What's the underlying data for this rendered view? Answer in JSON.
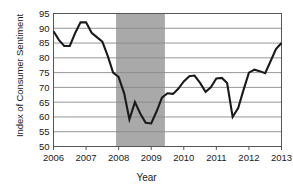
{
  "chart_data": {
    "type": "line",
    "title": "",
    "xlabel": "Year",
    "ylabel": "Index of Consumer Sentiment",
    "xlim": [
      2006.0,
      2013.0
    ],
    "ylim": [
      50,
      95
    ],
    "grid": true,
    "legend": null,
    "ytick_labels": [
      "50",
      "55",
      "60",
      "65",
      "70",
      "75",
      "80",
      "85",
      "90",
      "95"
    ],
    "ytick_values": [
      50,
      55,
      60,
      65,
      70,
      75,
      80,
      85,
      90,
      95
    ],
    "xtick_labels": [
      "2006",
      "2007",
      "2008",
      "2009",
      "2010",
      "2011",
      "2012",
      "2013"
    ],
    "xtick_values": [
      2006,
      2007,
      2008,
      2009,
      2010,
      2011,
      2012,
      2013
    ],
    "line_color": "#1a1a1a",
    "line_width": 2.1,
    "shaded_region": {
      "label": "recession-band",
      "x_start": 2007.92,
      "x_end": 2009.42,
      "color": "#a9a9a9"
    },
    "series": [
      {
        "name": "Index of Consumer Sentiment",
        "x": [
          2006.0,
          2006.17,
          2006.33,
          2006.5,
          2006.67,
          2006.83,
          2007.0,
          2007.17,
          2007.33,
          2007.5,
          2007.67,
          2007.83,
          2008.0,
          2008.17,
          2008.33,
          2008.5,
          2008.67,
          2008.83,
          2009.0,
          2009.17,
          2009.33,
          2009.5,
          2009.67,
          2009.83,
          2010.0,
          2010.17,
          2010.33,
          2010.5,
          2010.67,
          2010.83,
          2011.0,
          2011.17,
          2011.33,
          2011.5,
          2011.67,
          2011.83,
          2012.0,
          2012.17,
          2012.33,
          2012.5,
          2012.67,
          2012.83,
          2013.0
        ],
        "y": [
          89.0,
          86.0,
          84.0,
          84.0,
          88.5,
          92.0,
          92.0,
          88.5,
          87.0,
          85.5,
          80.5,
          75.0,
          73.5,
          68.0,
          59.2,
          65.0,
          61.0,
          58.0,
          57.8,
          62.0,
          66.5,
          68.0,
          67.8,
          69.5,
          72.0,
          73.8,
          74.0,
          71.5,
          68.5,
          70.0,
          73.0,
          73.2,
          71.5,
          60.0,
          63.0,
          69.0,
          75.0,
          76.0,
          75.5,
          74.8,
          79.0,
          83.0,
          85.0
        ]
      }
    ]
  }
}
